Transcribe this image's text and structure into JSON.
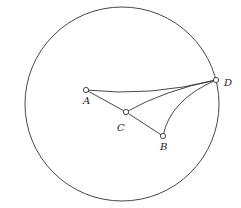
{
  "diagram": {
    "circle": {
      "cx": 122,
      "cy": 104,
      "r": 97
    },
    "points": [
      {
        "id": "A",
        "label": "A",
        "x": 86,
        "y": 90,
        "lx": 83,
        "ly": 104
      },
      {
        "id": "B",
        "label": "B",
        "x": 163,
        "y": 136,
        "lx": 160,
        "ly": 150
      },
      {
        "id": "C",
        "label": "C",
        "x": 126,
        "y": 112,
        "lx": 117,
        "ly": 131
      },
      {
        "id": "D",
        "label": "D",
        "x": 216,
        "y": 80,
        "lx": 224,
        "ly": 86
      }
    ],
    "edges": [
      {
        "from": "A",
        "to": "C",
        "type": "straight"
      },
      {
        "from": "C",
        "to": "B",
        "type": "straight"
      },
      {
        "from": "A",
        "to": "D",
        "type": "arc"
      },
      {
        "from": "C",
        "to": "D",
        "type": "arc"
      },
      {
        "from": "B",
        "to": "D",
        "type": "arc"
      }
    ]
  }
}
